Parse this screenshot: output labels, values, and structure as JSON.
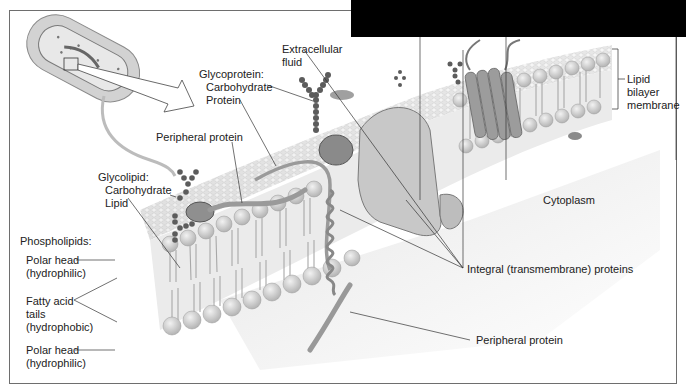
{
  "figure": {
    "labels": {
      "extracellular_fluid": [
        "Extracellular",
        "fluid"
      ],
      "glycoprotein": [
        "Glycoprotein:",
        "Carbohydrate",
        "Protein"
      ],
      "peripheral_protein_top": "Peripheral protein",
      "glycolipid": [
        "Glycolipid:",
        "Carbohydrate",
        "Lipid"
      ],
      "phospholipids": "Phospholipids:",
      "polar_head_top": [
        "Polar head",
        "(hydrophilic)"
      ],
      "fatty_acid_tails": [
        "Fatty acid",
        "tails",
        "(hydrophobic)"
      ],
      "polar_head_bottom": [
        "Polar head",
        "(hydrophilic)"
      ],
      "lipid_bilayer": [
        "Lipid",
        "bilayer",
        "membrane"
      ],
      "cytoplasm": "Cytoplasm",
      "integral_proteins": "Integral (transmembrane) proteins",
      "peripheral_protein_bottom": "Peripheral protein"
    },
    "colors": {
      "membrane_surface": "#d9d9d9",
      "lipid_head": "#cfcfcf",
      "protein": "#9a9a9a",
      "carbohydrate": "#5a5a5a",
      "background": "#ffffff",
      "redaction": "#000000"
    }
  }
}
